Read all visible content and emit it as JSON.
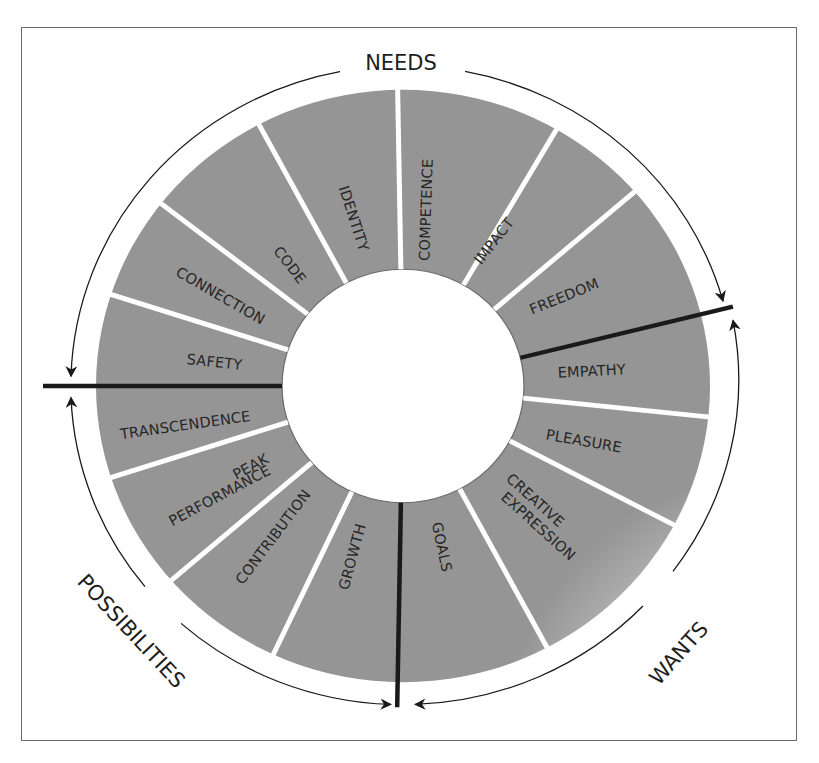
{
  "diagram": {
    "center": {
      "x": 403,
      "y": 386
    },
    "outer_radius": 307,
    "inner_radius": 121,
    "arc_radius": 332,
    "colors": {
      "segment_outer": "#9a9a9a",
      "segment_inner": "#e6e6e6",
      "divider_white": "#ffffff",
      "divider_thick": "#1a1a1a",
      "text": "#262626",
      "frame": "#6a6a6a"
    },
    "groups": [
      {
        "id": "needs",
        "label": "NEEDS"
      },
      {
        "id": "wants",
        "label": "WANTS"
      },
      {
        "id": "possibilities",
        "label": "POSSIBILITIES"
      }
    ],
    "segments": [
      {
        "label": "COMPETENCE",
        "group": "needs"
      },
      {
        "label": "IMPACT",
        "group": "needs"
      },
      {
        "label": "FREEDOM",
        "group": "needs"
      },
      {
        "label": "EMPATHY",
        "group": "wants"
      },
      {
        "label": "PLEASURE",
        "group": "wants"
      },
      {
        "label_lines": [
          "CREATIVE",
          "EXPRESSION"
        ],
        "group": "wants"
      },
      {
        "label": "GOALS",
        "group": "wants"
      },
      {
        "label": "GROWTH",
        "group": "possibilities"
      },
      {
        "label": "CONTRIBUTION",
        "group": "possibilities"
      },
      {
        "label_lines": [
          "PEAK",
          "PERFORMANCE"
        ],
        "group": "possibilities"
      },
      {
        "label": "TRANSCENDENCE",
        "group": "possibilities"
      },
      {
        "label": "SAFETY",
        "group": "needs"
      },
      {
        "label": "CONNECTION",
        "group": "needs"
      },
      {
        "label": "CODE",
        "group": "needs"
      },
      {
        "label": "IDENTITY",
        "group": "needs"
      }
    ],
    "labels": {
      "needs": "NEEDS",
      "wants": "WANTS",
      "possibilities": "POSSIBILITIES",
      "competence": "COMPETENCE",
      "impact": "IMPACT",
      "freedom": "FREEDOM",
      "empathy": "EMPATHY",
      "pleasure": "PLEASURE",
      "creative_1": "CREATIVE",
      "creative_2": "EXPRESSION",
      "goals": "GOALS",
      "growth": "GROWTH",
      "contribution": "CONTRIBUTION",
      "peak_1": "PEAK",
      "peak_2": "PERFORMANCE",
      "transcendence": "TRANSCENDENCE",
      "safety": "SAFETY",
      "connection": "CONNECTION",
      "code": "CODE",
      "identity": "IDENTITY"
    }
  }
}
